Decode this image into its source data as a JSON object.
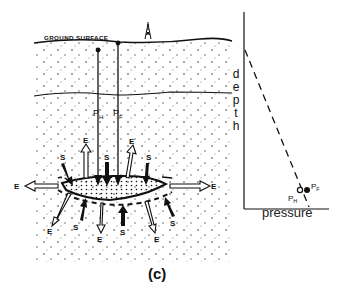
{
  "figure": {
    "caption": "(c)",
    "cross_section": {
      "ground_label": "GROUND SURFACE",
      "wells": [
        {
          "label_main": "P",
          "label_sub": "H"
        },
        {
          "label_main": "P",
          "label_sub": "F"
        }
      ],
      "stress_label": "S",
      "extension_label": "E",
      "arrows": {
        "stress_count": 6,
        "extension_count": 8
      }
    },
    "plot": {
      "y_axis_label": "depth",
      "x_axis_label": "pressure",
      "points": [
        {
          "label_main": "P",
          "label_sub": "H",
          "style": "open circle"
        },
        {
          "label_main": "P",
          "label_sub": "F",
          "style": "filled circle"
        }
      ],
      "line_style": "dashed"
    }
  }
}
